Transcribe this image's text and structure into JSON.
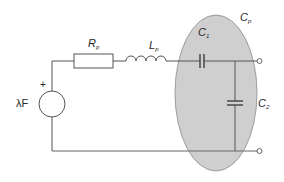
{
  "diagram": {
    "type": "circuit-schematic",
    "colors": {
      "wire": "#555555",
      "ellipse_fill": "#cfcfcf",
      "ellipse_stroke": "#8a8a8a",
      "label": "#2a2a2a"
    },
    "components": {
      "source": {
        "label_main": "λF",
        "polarity": "+"
      },
      "resistor": {
        "label_main": "R",
        "label_sub": "p"
      },
      "inductor": {
        "label_main": "L",
        "label_sub": "p"
      },
      "capacitor_series": {
        "label_main": "C",
        "label_sub": "1"
      },
      "capacitor_shunt": {
        "label_main": "C",
        "label_sub": "2"
      },
      "enclosure": {
        "label_main": "C",
        "label_sub": "p"
      }
    },
    "terminals": [
      "top-output-terminal",
      "bottom-output-terminal"
    ]
  }
}
